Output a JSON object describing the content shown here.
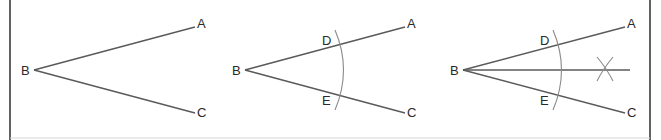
{
  "figure": {
    "colors": {
      "line": "#5a5a5a",
      "arc": "#8a8a8a",
      "frame": "#3a3a3a",
      "text": "#2a2a2a"
    },
    "panels": [
      {
        "step": 1,
        "labels": {
          "vertex": "B",
          "upper": "A",
          "lower": "C"
        }
      },
      {
        "step": 2,
        "labels": {
          "vertex": "B",
          "upper": "A",
          "lower": "C",
          "arc_upper": "D",
          "arc_lower": "E"
        }
      },
      {
        "step": 3,
        "labels": {
          "vertex": "B",
          "upper": "A",
          "lower": "C",
          "arc_upper": "D",
          "arc_lower": "E"
        }
      }
    ]
  }
}
